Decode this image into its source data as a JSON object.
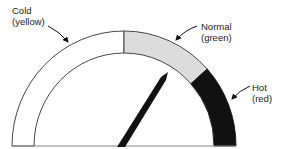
{
  "diagram": {
    "type": "gauge",
    "zones": [
      {
        "name": "Cold",
        "color_name": "yellow",
        "fill": "#ffffff",
        "start_deg": 90,
        "end_deg": 180
      },
      {
        "name": "Normal",
        "color_name": "green",
        "fill": "#dcdcdc",
        "start_deg": 42,
        "end_deg": 90
      },
      {
        "name": "Hot",
        "color_name": "red",
        "fill": "#111111",
        "start_deg": 0,
        "end_deg": 42
      }
    ],
    "needle": {
      "angle_deg": 58,
      "color": "#111111"
    }
  },
  "labels": {
    "cold": {
      "line1": "Cold",
      "line2": "(yellow)"
    },
    "normal": {
      "line1": "Normal",
      "line2": "(green)"
    },
    "hot": {
      "line1": "Hot",
      "line2": "(red)"
    }
  }
}
